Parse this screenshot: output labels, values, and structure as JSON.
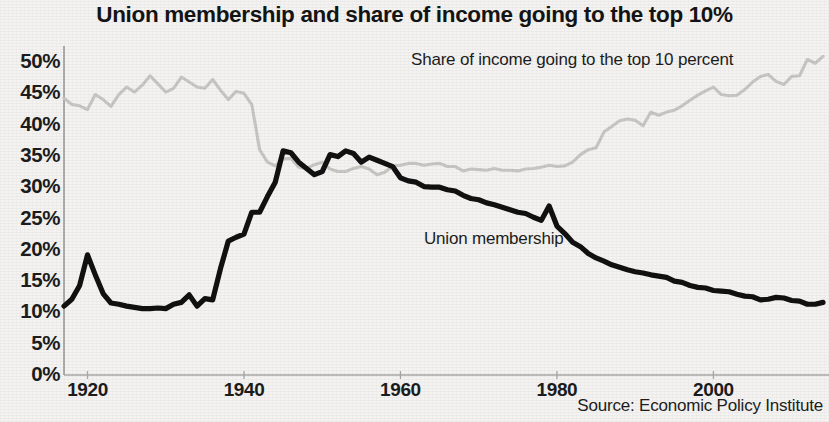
{
  "chart_data": {
    "type": "line",
    "title": "Union membership and share of income going to the top 10%",
    "xlabel": "",
    "ylabel": "",
    "xlim": [
      1917,
      2014
    ],
    "ylim": [
      0,
      52
    ],
    "grid": false,
    "legend_position": "inline-annotations",
    "source": "Source: Economic Policy Institute",
    "x_ticks": [
      1920,
      1940,
      1960,
      1980,
      2000
    ],
    "x_tick_labels": [
      "1920",
      "1940",
      "1960",
      "1980",
      "2000"
    ],
    "y_ticks": [
      0,
      5,
      10,
      15,
      20,
      25,
      30,
      35,
      40,
      45,
      50
    ],
    "y_tick_labels": [
      "0%",
      "5%",
      "10%",
      "15%",
      "20%",
      "25%",
      "30%",
      "35%",
      "40%",
      "45%",
      "50%"
    ],
    "series": [
      {
        "name": "Union membership",
        "color": "#111111",
        "label_x": 1963,
        "label_y": 21,
        "x": [
          1917,
          1918,
          1919,
          1920,
          1921,
          1922,
          1923,
          1924,
          1925,
          1926,
          1927,
          1928,
          1929,
          1930,
          1931,
          1932,
          1933,
          1934,
          1935,
          1936,
          1937,
          1938,
          1939,
          1940,
          1941,
          1942,
          1943,
          1944,
          1945,
          1946,
          1947,
          1948,
          1949,
          1950,
          1951,
          1952,
          1953,
          1954,
          1955,
          1956,
          1957,
          1958,
          1959,
          1960,
          1961,
          1962,
          1963,
          1964,
          1965,
          1966,
          1967,
          1968,
          1969,
          1970,
          1971,
          1972,
          1973,
          1974,
          1975,
          1976,
          1977,
          1978,
          1979,
          1980,
          1981,
          1982,
          1983,
          1984,
          1985,
          1986,
          1987,
          1988,
          1989,
          1990,
          1991,
          1992,
          1993,
          1994,
          1995,
          1996,
          1997,
          1998,
          1999,
          2000,
          2001,
          2002,
          2003,
          2004,
          2005,
          2006,
          2007,
          2008,
          2009,
          2010,
          2011,
          2012,
          2013,
          2014
        ],
        "y": [
          11.0,
          12.1,
          14.3,
          19.2,
          16.0,
          13.0,
          11.5,
          11.3,
          11.0,
          10.8,
          10.6,
          10.6,
          10.7,
          10.6,
          11.3,
          11.6,
          12.8,
          11.0,
          12.2,
          12.0,
          17.0,
          21.4,
          22.0,
          22.5,
          26.0,
          26.0,
          28.5,
          30.8,
          35.8,
          35.5,
          34.0,
          33.0,
          32.0,
          32.5,
          35.2,
          34.9,
          35.8,
          35.4,
          34.0,
          34.8,
          34.3,
          33.8,
          33.3,
          31.5,
          31.0,
          30.8,
          30.1,
          30.0,
          30.0,
          29.6,
          29.4,
          28.7,
          28.2,
          28.0,
          27.5,
          27.2,
          26.8,
          26.4,
          26.0,
          25.8,
          25.2,
          24.7,
          27.0,
          23.8,
          22.6,
          21.2,
          20.5,
          19.4,
          18.7,
          18.2,
          17.6,
          17.2,
          16.8,
          16.5,
          16.3,
          16.0,
          15.8,
          15.6,
          15.0,
          14.8,
          14.3,
          14.0,
          13.9,
          13.5,
          13.4,
          13.3,
          12.9,
          12.6,
          12.5,
          12.0,
          12.1,
          12.4,
          12.3,
          11.9,
          11.8,
          11.3,
          11.3,
          11.6
        ]
      },
      {
        "name": "Share of income going to the top 10 percent",
        "color": "#c8c6c3",
        "label_x": 1960,
        "label_y": 48.5,
        "x": [
          1917,
          1918,
          1919,
          1920,
          1921,
          1922,
          1923,
          1924,
          1925,
          1926,
          1927,
          1928,
          1929,
          1930,
          1931,
          1932,
          1933,
          1934,
          1935,
          1936,
          1937,
          1938,
          1939,
          1940,
          1941,
          1942,
          1943,
          1944,
          1945,
          1946,
          1947,
          1948,
          1949,
          1950,
          1951,
          1952,
          1953,
          1954,
          1955,
          1956,
          1957,
          1958,
          1959,
          1960,
          1961,
          1962,
          1963,
          1964,
          1965,
          1966,
          1967,
          1968,
          1969,
          1970,
          1971,
          1972,
          1973,
          1974,
          1975,
          1976,
          1977,
          1978,
          1979,
          1980,
          1981,
          1982,
          1983,
          1984,
          1985,
          1986,
          1987,
          1988,
          1989,
          1990,
          1991,
          1992,
          1993,
          1994,
          1995,
          1996,
          1997,
          1998,
          1999,
          2000,
          2001,
          2002,
          2003,
          2004,
          2005,
          2006,
          2007,
          2008,
          2009,
          2010,
          2011,
          2012,
          2013,
          2014
        ],
        "y": [
          44.2,
          43.2,
          43.0,
          42.4,
          44.8,
          44.0,
          42.9,
          44.8,
          46.0,
          45.2,
          46.3,
          47.8,
          46.5,
          45.2,
          45.8,
          47.6,
          46.8,
          46.0,
          45.8,
          47.2,
          45.5,
          44.0,
          45.3,
          45.0,
          43.2,
          36.0,
          34.0,
          33.4,
          34.5,
          34.6,
          33.2,
          33.0,
          33.6,
          34.0,
          32.9,
          32.5,
          32.5,
          33.0,
          33.3,
          32.9,
          32.0,
          32.4,
          33.4,
          33.5,
          33.8,
          33.8,
          33.5,
          33.7,
          33.8,
          33.3,
          33.3,
          32.6,
          32.9,
          32.8,
          32.7,
          33.0,
          32.7,
          32.7,
          32.6,
          32.9,
          33.0,
          33.2,
          33.5,
          33.3,
          33.4,
          34.0,
          35.2,
          36.0,
          36.3,
          38.8,
          39.7,
          40.6,
          40.9,
          40.7,
          39.8,
          42.0,
          41.5,
          42.0,
          42.3,
          43.0,
          43.9,
          44.7,
          45.4,
          46.0,
          44.8,
          44.6,
          44.7,
          45.6,
          46.8,
          47.7,
          48.0,
          46.9,
          46.4,
          47.7,
          47.8,
          50.4,
          49.8,
          50.9
        ]
      }
    ]
  }
}
